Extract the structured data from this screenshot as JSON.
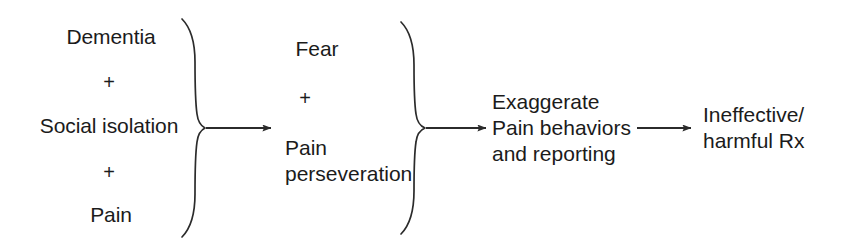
{
  "diagram": {
    "stroke_color": "#2b2b2b",
    "text_color": "#1b1b1b",
    "background_color": "#ffffff",
    "groups": {
      "inputs": {
        "name": "inputs-group",
        "items": [
          {
            "label": "Dementia"
          },
          {
            "label": "+"
          },
          {
            "label": "Social isolation"
          },
          {
            "label": "+"
          },
          {
            "label": "Pain"
          }
        ]
      },
      "mediators": {
        "name": "mediators-group",
        "items": [
          {
            "label": "Fear"
          },
          {
            "label": "+"
          },
          {
            "label": "Pain",
            "label2": "perseveration"
          }
        ]
      },
      "outcome": {
        "name": "outcome-group",
        "lines": [
          "Exaggerate",
          "Pain behaviors",
          "and reporting"
        ]
      },
      "consequence": {
        "name": "consequence-group",
        "lines": [
          "Ineffective/",
          "harmful Rx"
        ]
      }
    },
    "connectors": {
      "brace_1": "left-brace-inputs",
      "brace_2": "left-brace-mediators",
      "arrow_1": "arrow-inputs-to-mediators",
      "arrow_2": "arrow-mediators-to-outcome",
      "arrow_3": "arrow-outcome-to-consequence"
    }
  }
}
